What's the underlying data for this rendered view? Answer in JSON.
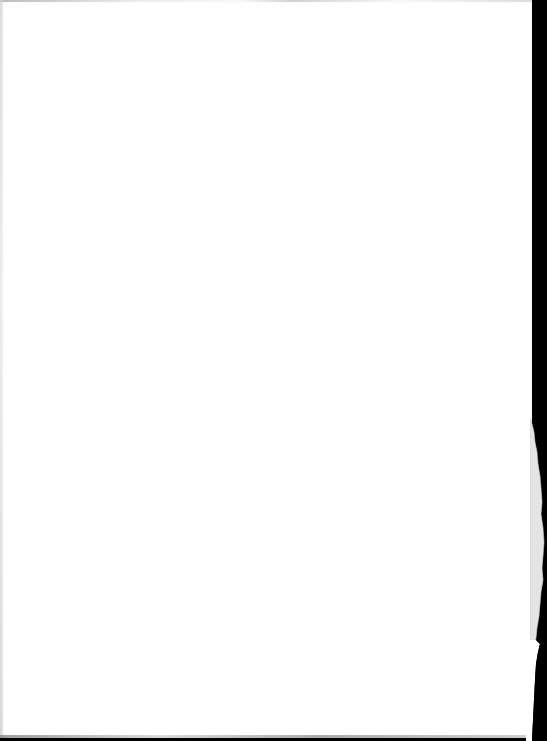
{
  "document": {
    "type": "blank-paper-scan",
    "text": "",
    "colors": {
      "paper": "#ffffff",
      "background": "#000000",
      "torn_edge": "#e4e4e4"
    }
  }
}
